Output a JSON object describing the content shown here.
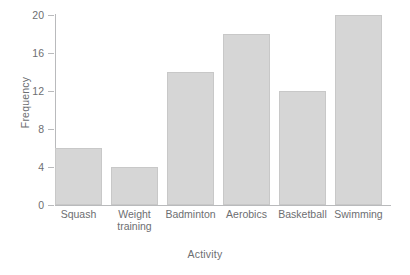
{
  "chart_data": {
    "type": "bar",
    "title": "",
    "subtitle": "",
    "xlabel": "Activity",
    "ylabel": "Frequency",
    "categories": [
      "Squash",
      "Weight\ntraining",
      "Badminton",
      "Aerobics",
      "Basketball",
      "Swimming"
    ],
    "values": [
      6,
      4,
      14,
      18,
      12,
      20
    ],
    "ylim": [
      0,
      20
    ],
    "yticks": [
      0,
      4,
      8,
      12,
      16,
      20
    ],
    "ytick_labels": [
      "0",
      "4",
      "8",
      "12",
      "16",
      "20"
    ],
    "grid": false,
    "legend": false,
    "legend_position": "none",
    "bar_color": "#d6d6d6",
    "bar_border_color": "#c8c8c8",
    "axis_color": "#b9babc",
    "text_color": "#6d6e71",
    "background_color": "#ffffff"
  }
}
